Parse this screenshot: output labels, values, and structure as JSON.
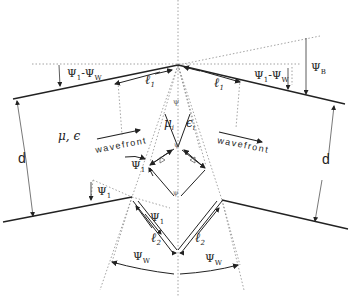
{
  "diagram": {
    "type": "geometry-schematic",
    "colors": {
      "line": "#222222",
      "dotted": "#9a9a9a",
      "background": "#ffffff"
    },
    "labels": {
      "psi1_minus_psiw_left": {
        "psi": "Ψ",
        "sub1": "1",
        "minus": "-",
        "psi2": "Ψ",
        "sub2": "W"
      },
      "psi1_minus_psiw_right": {
        "psi": "Ψ",
        "sub1": "1",
        "minus": "-",
        "psi2": "Ψ",
        "sub2": "W"
      },
      "psi_b": {
        "psi": "Ψ",
        "sub": "B"
      },
      "l1_left": {
        "l": "ℓ",
        "sub": "1"
      },
      "l1_right": {
        "l": "ℓ",
        "sub": "1"
      },
      "mu_eps_outer": "μ, ϵ",
      "mu_inner": {
        "mu": "μ",
        "sub": "i"
      },
      "eps_inner": {
        "eps": "ϵ",
        "sub": "i"
      },
      "wavefront_left": "wavefront",
      "wavefront_right": "wavefront",
      "d_left": "d",
      "d_right": "d",
      "psi1_upper": {
        "psi": "Ψ",
        "sub": "1"
      },
      "psi1_lower": {
        "psi": "Ψ",
        "sub": "1"
      },
      "psi1_inner": {
        "psi": "Ψ",
        "sub": "1"
      },
      "l2_left": {
        "l": "ℓ",
        "sub": "2"
      },
      "l2_right": {
        "l": "ℓ",
        "sub": "2"
      },
      "psiw_left": {
        "psi": "Ψ",
        "sub": "W"
      },
      "psiw_right": {
        "psi": "Ψ",
        "sub": "W"
      },
      "delta_left": "Δ",
      "delta_right": "Δ",
      "apex_top_mark": "ψ",
      "apex_inner_mark": "ψ",
      "apex_bottom_mark": "ψ"
    }
  }
}
